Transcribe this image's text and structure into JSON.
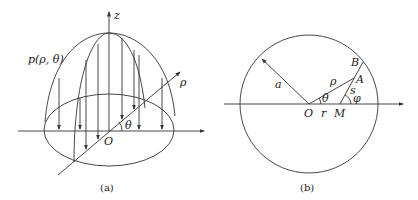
{
  "figure_a": {
    "caption": "(a)",
    "labels": {
      "z_axis": "z",
      "pressure": "p(ρ, θ)",
      "rho_axis": "ρ",
      "theta": "θ",
      "origin": "O"
    }
  },
  "figure_b": {
    "caption": "(b)",
    "labels": {
      "radius": "a",
      "rho": "ρ",
      "theta": "θ",
      "origin": "O",
      "r": "r",
      "M": "M",
      "s": "s",
      "phi": "φ",
      "A": "A",
      "B": "B"
    }
  },
  "colors": {
    "line": "#333333",
    "text": "#222222",
    "background": "#ffffff"
  }
}
